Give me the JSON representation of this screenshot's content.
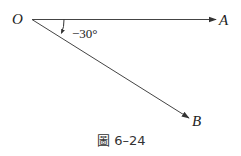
{
  "figure": {
    "caption": "圖 6–24",
    "points": {
      "origin": "O",
      "a": "A",
      "b": "B"
    },
    "angle_label": "−30°",
    "colors": {
      "line": "#333333",
      "text": "#222222"
    }
  }
}
